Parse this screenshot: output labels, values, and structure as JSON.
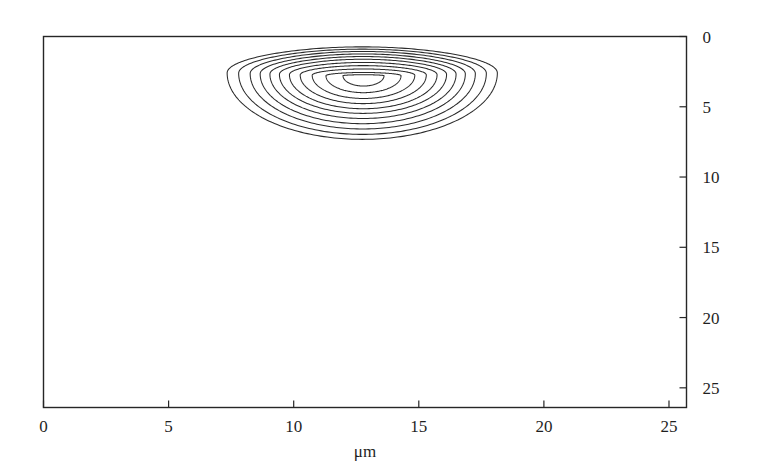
{
  "chart_data": {
    "type": "line",
    "subtype": "contour",
    "title": "",
    "subtitle": "",
    "xlabel": "μm",
    "ylabel": "",
    "xlim": [
      0,
      25.7
    ],
    "ylim": [
      26.4,
      0
    ],
    "y_axis_inverted": true,
    "y_axis_position": "right",
    "grid": false,
    "legend": null,
    "annotations": [],
    "xticks": [
      0,
      5,
      10,
      15,
      20,
      25
    ],
    "xtick_labels": [
      "0",
      "5",
      "10",
      "15",
      "20",
      "25"
    ],
    "yticks": [
      0,
      5,
      10,
      15,
      20,
      25
    ],
    "ytick_labels": [
      "0",
      "5",
      "10",
      "15",
      "20",
      "25"
    ],
    "contour_count": 11,
    "contour_center": [
      12.8,
      2.8
    ],
    "contour_extent_x": [
      7.6,
      18.3
    ],
    "contour_extent_y": [
      0.8,
      7.4
    ],
    "contours": [
      {
        "level": 1,
        "cx": 12.79,
        "cy": 2.79,
        "rx": 0.82,
        "ry": 0.7,
        "top_flat": 0.1,
        "bottom_stretch": 1.05
      },
      {
        "level": 2,
        "cx": 12.79,
        "cy": 2.79,
        "rx": 1.5,
        "ry": 1.05,
        "top_flat": 0.22,
        "bottom_stretch": 1.15
      },
      {
        "level": 3,
        "cx": 12.79,
        "cy": 2.76,
        "rx": 2.05,
        "ry": 1.32,
        "top_flat": 0.34,
        "bottom_stretch": 1.25
      },
      {
        "level": 4,
        "cx": 12.78,
        "cy": 2.74,
        "rx": 2.52,
        "ry": 1.52,
        "top_flat": 0.44,
        "bottom_stretch": 1.34
      },
      {
        "level": 5,
        "cx": 12.78,
        "cy": 2.72,
        "rx": 2.95,
        "ry": 1.68,
        "top_flat": 0.52,
        "bottom_stretch": 1.44
      },
      {
        "level": 6,
        "cx": 12.77,
        "cy": 2.7,
        "rx": 3.34,
        "ry": 1.8,
        "top_flat": 0.6,
        "bottom_stretch": 1.54
      },
      {
        "level": 7,
        "cx": 12.77,
        "cy": 2.68,
        "rx": 3.72,
        "ry": 1.9,
        "top_flat": 0.66,
        "bottom_stretch": 1.66
      },
      {
        "level": 8,
        "cx": 12.76,
        "cy": 2.66,
        "rx": 4.1,
        "ry": 1.97,
        "top_flat": 0.72,
        "bottom_stretch": 1.8
      },
      {
        "level": 9,
        "cx": 12.76,
        "cy": 2.64,
        "rx": 4.5,
        "ry": 2.02,
        "top_flat": 0.78,
        "bottom_stretch": 1.95
      },
      {
        "level": 10,
        "cx": 12.75,
        "cy": 2.62,
        "rx": 4.95,
        "ry": 2.05,
        "top_flat": 0.84,
        "bottom_stretch": 2.12
      },
      {
        "level": 11,
        "cx": 12.74,
        "cy": 2.6,
        "rx": 5.4,
        "ry": 2.07,
        "top_flat": 0.9,
        "bottom_stretch": 2.28
      }
    ]
  },
  "axes": {
    "frame_color": "#262626",
    "contour_color": "#2b2b2b",
    "background": "#ffffff",
    "xlabel": "μm"
  },
  "x_labels": [
    "0",
    "5",
    "10",
    "15",
    "20",
    "25"
  ],
  "y_labels": [
    "0",
    "5",
    "10",
    "15",
    "20",
    "25"
  ]
}
